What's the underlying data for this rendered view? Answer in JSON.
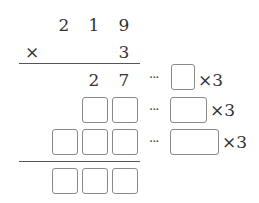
{
  "problem": {
    "multiplicand": [
      "2",
      "1",
      "9"
    ],
    "operator": "×",
    "multiplier": "3",
    "partial_row1": [
      "2",
      "7"
    ],
    "dots": "···",
    "times_label": "×3",
    "row_boxes": {
      "row1_side": 1,
      "row2": 2,
      "row3": 3,
      "result": 3
    }
  }
}
